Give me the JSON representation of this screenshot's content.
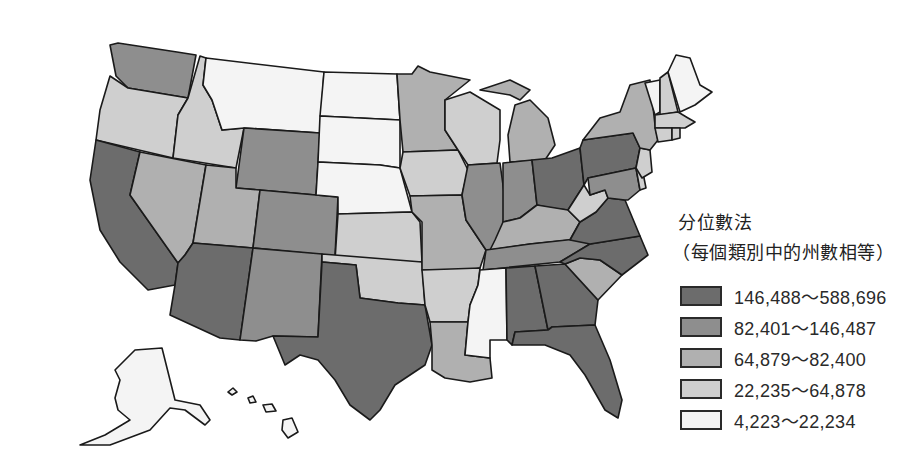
{
  "legend": {
    "title": "分位數法",
    "subtitle": "（每個類別中的州數相等）",
    "classes": [
      {
        "label": "146,488～588,696",
        "color": "#6c6c6c"
      },
      {
        "label": "82,401～146,487",
        "color": "#8e8e8e"
      },
      {
        "label": "64,879～82,400",
        "color": "#b0b0b0"
      },
      {
        "label": "22,235～64,878",
        "color": "#cfcfcf"
      },
      {
        "label": "4,223～22,234",
        "color": "#f4f4f4"
      }
    ]
  },
  "map_data": {
    "type": "choropleth",
    "region": "United States",
    "classification": "quantile",
    "states": {
      "WA": 2,
      "OR": 4,
      "CA": 1,
      "ID": 4,
      "MT": 5,
      "WY": 2,
      "NV": 3,
      "UT": 3,
      "CO": 2,
      "AZ": 1,
      "NM": 2,
      "ND": 5,
      "SD": 5,
      "NE": 5,
      "KS": 4,
      "OK": 4,
      "TX": 1,
      "MN": 3,
      "IA": 4,
      "MO": 3,
      "AR": 4,
      "LA": 3,
      "WI": 4,
      "IL": 2,
      "MS": 5,
      "MI": 3,
      "IN": 2,
      "KY": 3,
      "TN": 2,
      "AL": 1,
      "OH": 1,
      "WV": 4,
      "VA": 1,
      "NC": 1,
      "SC": 3,
      "GA": 1,
      "FL": 1,
      "PA": 1,
      "NY": 3,
      "VT": 5,
      "NH": 4,
      "ME": 5,
      "MA": 4,
      "RI": 4,
      "CT": 4,
      "NJ": 4,
      "DE": 4,
      "MD": 2,
      "AK": 5,
      "HI": 5
    }
  }
}
